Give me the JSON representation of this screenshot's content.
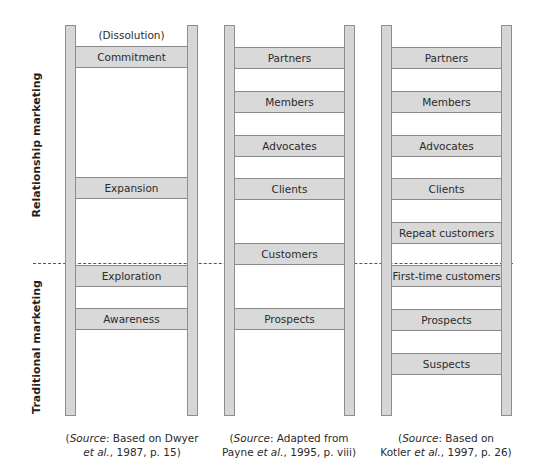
{
  "side_labels": {
    "upper": "Relationship marketing",
    "lower": "Traditional marketing"
  },
  "ladders": [
    {
      "above": "(Dissolution)",
      "rungs": [
        {
          "label": "Commitment",
          "top": 46
        },
        {
          "label": "Expansion",
          "top": 177
        },
        {
          "label": "Exploration",
          "top": 265
        },
        {
          "label": "Awareness",
          "top": 308
        }
      ],
      "source": {
        "prefix": "(",
        "italic1": "Source",
        "mid1": ": Based on Dwyer",
        "italic2": "et al.",
        "mid2": ", 1987, p. 15)"
      }
    },
    {
      "rungs": [
        {
          "label": "Partners",
          "top": 47
        },
        {
          "label": "Members",
          "top": 91
        },
        {
          "label": "Advocates",
          "top": 135
        },
        {
          "label": "Clients",
          "top": 178
        },
        {
          "label": "Customers",
          "top": 243
        },
        {
          "label": "Prospects",
          "top": 308
        }
      ],
      "source": {
        "prefix": "(",
        "italic1": "Source",
        "mid1": ": Adapted from",
        "line2_pre": "Payne ",
        "italic2": "et al.",
        "mid2": ", 1995, p. viii)"
      }
    },
    {
      "rungs": [
        {
          "label": "Partners",
          "top": 47
        },
        {
          "label": "Members",
          "top": 91
        },
        {
          "label": "Advocates",
          "top": 135
        },
        {
          "label": "Clients",
          "top": 178
        },
        {
          "label": "Repeat customers",
          "top": 222
        },
        {
          "label": "First-time customers",
          "top": 265
        },
        {
          "label": "Prospects",
          "top": 309
        },
        {
          "label": "Suspects",
          "top": 353
        }
      ],
      "source": {
        "prefix": "(",
        "italic1": "Source",
        "mid1": ": Based on",
        "line2_pre": "Kotler ",
        "italic2": "et al.",
        "mid2": ", 1997, p. 26)"
      }
    }
  ]
}
